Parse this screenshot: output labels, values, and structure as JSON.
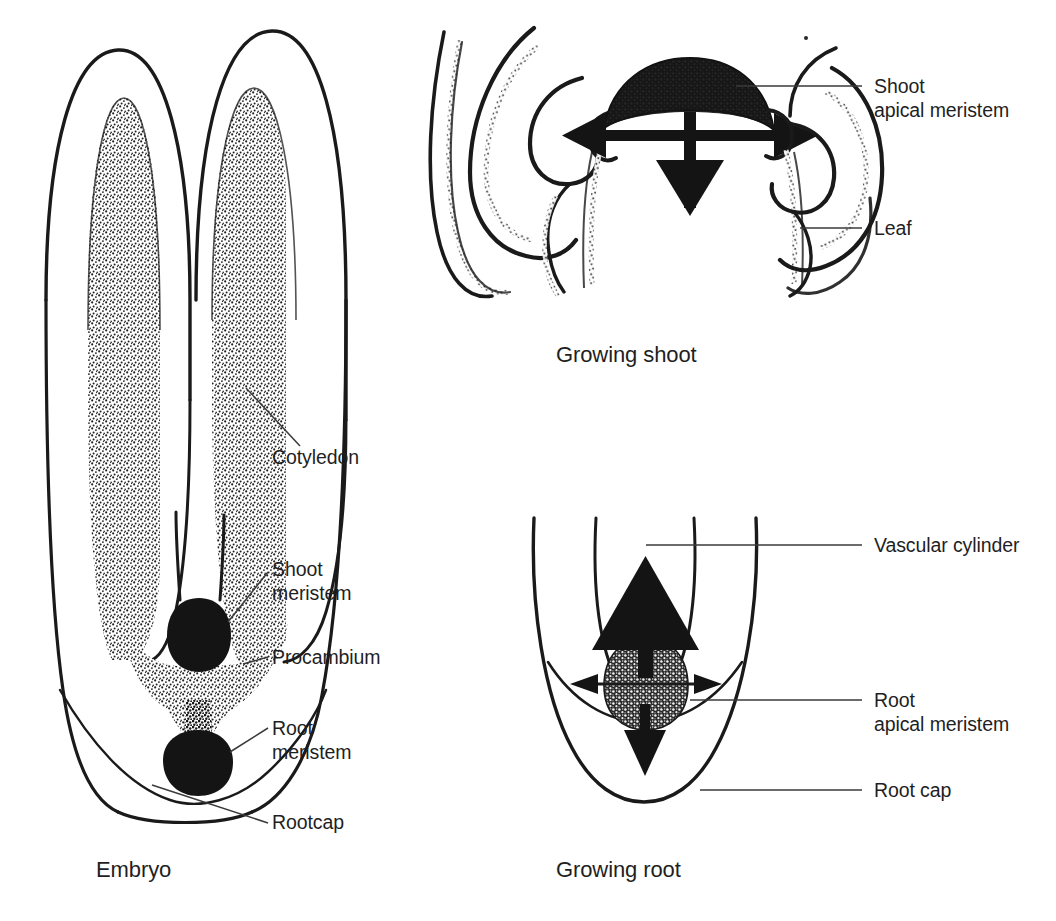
{
  "document": {
    "kind": "botanical-diagram",
    "background_color": "#ffffff",
    "ink_color": "#1a1a1a"
  },
  "figures": [
    {
      "id": "embryo",
      "caption": "Embryo",
      "labels": [
        {
          "id": "cotyledon",
          "text": "Cotyledon"
        },
        {
          "id": "shoot-meristem",
          "line1": "Shoot",
          "line2": "meristem"
        },
        {
          "id": "procambium",
          "text": "Procambium"
        },
        {
          "id": "root-meristem",
          "line1": "Root",
          "line2": "meristem"
        },
        {
          "id": "rootcap",
          "text": "Rootcap"
        }
      ]
    },
    {
      "id": "growing-shoot",
      "caption": "Growing shoot",
      "labels": [
        {
          "id": "shoot-apical-meristem",
          "line1": "Shoot",
          "line2": "apical meristem"
        },
        {
          "id": "leaf",
          "text": "Leaf"
        }
      ]
    },
    {
      "id": "growing-root",
      "caption": "Growing root",
      "labels": [
        {
          "id": "vascular-cylinder",
          "text": "Vascular cylinder"
        },
        {
          "id": "root-apical-meristem",
          "line1": "Root",
          "line2": "apical meristem"
        },
        {
          "id": "root-cap",
          "text": "Root cap"
        }
      ]
    }
  ],
  "labels": {
    "cotyledon": "Cotyledon",
    "shoot_meristem_l1": "Shoot",
    "shoot_meristem_l2": "meristem",
    "procambium": "Procambium",
    "root_meristem_l1": "Root",
    "root_meristem_l2": "meristem",
    "rootcap": "Rootcap",
    "shoot_apical_l1": "Shoot",
    "shoot_apical_l2": "apical meristem",
    "leaf": "Leaf",
    "vascular_cylinder": "Vascular cylinder",
    "root_apical_l1": "Root",
    "root_apical_l2": "apical meristem",
    "root_cap": "Root cap"
  },
  "captions": {
    "embryo": "Embryo",
    "growing_shoot": "Growing shoot",
    "growing_root": "Growing root"
  }
}
